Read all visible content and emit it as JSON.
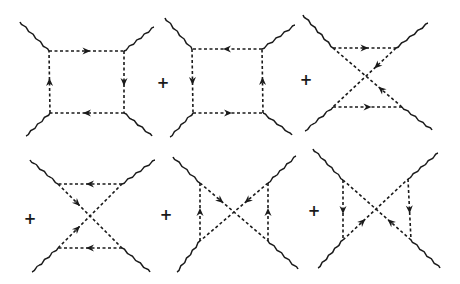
{
  "figure": {
    "operator": "+",
    "colors": {
      "ink": "#1a1a1a",
      "background": "#ffffff"
    },
    "diagrams": [
      {
        "id": "d1",
        "topology": "box",
        "vertices": {
          "tl": [
            49,
            51
          ],
          "tr": [
            124,
            51
          ],
          "bl": [
            50,
            113
          ],
          "br": [
            124,
            113
          ]
        },
        "legs": [
          [
            20,
            22,
            49,
            51
          ],
          [
            154,
            27,
            124,
            51
          ],
          [
            26,
            136,
            50,
            113
          ],
          [
            152,
            136,
            124,
            113
          ]
        ],
        "edges": [
          [
            "tl",
            "tr",
            "forward"
          ],
          [
            "tr",
            "br",
            "forward"
          ],
          [
            "br",
            "bl",
            "forward"
          ],
          [
            "bl",
            "tl",
            "forward"
          ]
        ],
        "plus": null
      },
      {
        "id": "d2",
        "topology": "box",
        "vertices": {
          "tl": [
            192,
            49
          ],
          "tr": [
            262,
            49
          ],
          "bl": [
            193,
            113
          ],
          "br": [
            263,
            113
          ]
        },
        "legs": [
          [
            165,
            18,
            192,
            49
          ],
          [
            295,
            25,
            262,
            49
          ],
          [
            170,
            137,
            193,
            113
          ],
          [
            292,
            135,
            263,
            113
          ]
        ],
        "edges": [
          [
            "tr",
            "tl",
            "forward"
          ],
          [
            "tl",
            "bl",
            "forward"
          ],
          [
            "bl",
            "br",
            "forward"
          ],
          [
            "br",
            "tr",
            "forward"
          ]
        ],
        "plus": [
          163,
          83
        ]
      },
      {
        "id": "d3",
        "topology": "crossed-horizontal",
        "vertices": {
          "tl": [
            333,
            48
          ],
          "tr": [
            396,
            48
          ],
          "bl": [
            333,
            107
          ],
          "br": [
            402,
            107
          ]
        },
        "legs": [
          [
            303,
            15,
            333,
            48
          ],
          [
            428,
            23,
            396,
            48
          ],
          [
            305,
            131,
            333,
            107
          ],
          [
            432,
            130,
            402,
            107
          ]
        ],
        "edges": [
          [
            "tl",
            "tr",
            "forward"
          ],
          [
            "tr",
            "bl",
            "forward"
          ],
          [
            "bl",
            "br",
            "forward"
          ],
          [
            "br",
            "tl",
            "forward"
          ]
        ],
        "plus": [
          306,
          80
        ]
      },
      {
        "id": "d4",
        "topology": "crossed-horizontal",
        "vertices": {
          "tl": [
            58,
            184
          ],
          "tr": [
            122,
            184
          ],
          "bl": [
            58,
            248
          ],
          "br": [
            122,
            248
          ]
        },
        "legs": [
          [
            30,
            160,
            58,
            184
          ],
          [
            155,
            160,
            122,
            184
          ],
          [
            32,
            272,
            58,
            248
          ],
          [
            150,
            272,
            122,
            248
          ]
        ],
        "edges": [
          [
            "tr",
            "tl",
            "forward"
          ],
          [
            "tl",
            "br",
            "forward"
          ],
          [
            "br",
            "bl",
            "forward"
          ],
          [
            "bl",
            "tr",
            "forward"
          ]
        ],
        "plus": [
          30,
          219
        ]
      },
      {
        "id": "d5",
        "topology": "crossed-vertical",
        "vertices": {
          "tl": [
            200,
            183
          ],
          "tr": [
            268,
            183
          ],
          "bl": [
            200,
            241
          ],
          "br": [
            268,
            241
          ]
        },
        "legs": [
          [
            173,
            157,
            200,
            183
          ],
          [
            296,
            156,
            268,
            183
          ],
          [
            177,
            272,
            200,
            241
          ],
          [
            298,
            269,
            268,
            241
          ]
        ],
        "edges": [
          [
            "bl",
            "tl",
            "forward"
          ],
          [
            "tl",
            "br",
            "forward"
          ],
          [
            "br",
            "tr",
            "forward"
          ],
          [
            "tr",
            "bl",
            "forward"
          ]
        ],
        "plus": [
          166,
          215
        ]
      },
      {
        "id": "d6",
        "topology": "crossed-vertical",
        "vertices": {
          "tl": [
            343,
            180
          ],
          "tr": [
            408,
            179
          ],
          "bl": [
            343,
            240
          ],
          "br": [
            411,
            240
          ]
        },
        "legs": [
          [
            313,
            149,
            343,
            180
          ],
          [
            438,
            153,
            408,
            179
          ],
          [
            318,
            268,
            343,
            240
          ],
          [
            440,
            268,
            411,
            240
          ]
        ],
        "edges": [
          [
            "tl",
            "bl",
            "forward"
          ],
          [
            "bl",
            "tr",
            "forward"
          ],
          [
            "tr",
            "br",
            "forward"
          ],
          [
            "br",
            "tl",
            "forward"
          ]
        ],
        "plus": [
          314,
          211
        ]
      }
    ]
  }
}
